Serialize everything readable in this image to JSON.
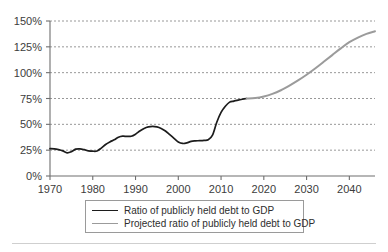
{
  "chart_data": {
    "type": "line",
    "title": "",
    "xlabel": "",
    "ylabel": "",
    "xlim": [
      1970,
      2046
    ],
    "ylim": [
      0,
      150
    ],
    "grid": true,
    "y_tick_labels": [
      "0%",
      "25%",
      "50%",
      "75%",
      "100%",
      "125%",
      "150%"
    ],
    "y_ticks": [
      0,
      25,
      50,
      75,
      100,
      125,
      150
    ],
    "x_tick_labels": [
      "1970",
      "1980",
      "1990",
      "2000",
      "2010",
      "2020",
      "2030",
      "2040"
    ],
    "x_ticks": [
      1970,
      1980,
      1990,
      2000,
      2010,
      2020,
      2030,
      2040
    ],
    "legend_position": "below",
    "series": [
      {
        "name": "Ratio of publicly held debt to GDP",
        "color": "#1c1c1c",
        "x": [
          1970,
          1971,
          1972,
          1973,
          1974,
          1975,
          1976,
          1977,
          1978,
          1979,
          1980,
          1981,
          1982,
          1983,
          1984,
          1985,
          1986,
          1987,
          1988,
          1989,
          1990,
          1991,
          1992,
          1993,
          1994,
          1995,
          1996,
          1997,
          1998,
          1999,
          2000,
          2001,
          2002,
          2003,
          2004,
          2005,
          2006,
          2007,
          2008,
          2009,
          2010,
          2011,
          2012,
          2013,
          2014,
          2015,
          2016
        ],
        "values": [
          26.5,
          26.3,
          25.5,
          24.3,
          22.4,
          23.5,
          26.0,
          26.3,
          25.5,
          24.3,
          24.0,
          24.2,
          27.0,
          30.5,
          33.0,
          35.0,
          37.5,
          38.5,
          38.3,
          38.5,
          40.5,
          43.5,
          46.0,
          47.5,
          48.0,
          47.5,
          46.0,
          43.5,
          40.0,
          36.5,
          33.0,
          31.5,
          32.0,
          33.5,
          34.0,
          34.2,
          34.5,
          35.0,
          39.5,
          52.0,
          61.5,
          67.5,
          71.5,
          72.5,
          73.5,
          74.3,
          75.0
        ]
      },
      {
        "name": "Projected ratio of publicly held debt to GDP",
        "color": "#9b9b9b",
        "x": [
          2016,
          2018,
          2020,
          2022,
          2024,
          2026,
          2028,
          2030,
          2032,
          2034,
          2036,
          2038,
          2040,
          2042,
          2044,
          2046
        ],
        "values": [
          75.0,
          75.5,
          77.0,
          79.5,
          83.0,
          87.5,
          92.5,
          98.0,
          104.0,
          110.5,
          117.0,
          123.5,
          129.5,
          134.0,
          137.5,
          140.0
        ]
      }
    ]
  },
  "legend": {
    "items": [
      {
        "label": "Ratio of publicly held debt to GDP"
      },
      {
        "label": "Projected ratio of publicly held debt to GDP"
      }
    ]
  }
}
